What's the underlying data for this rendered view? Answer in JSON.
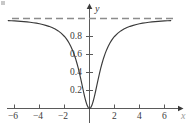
{
  "chart_data": {
    "type": "line",
    "title": "",
    "subtitle": "",
    "xlabel": "x",
    "ylabel": "y",
    "xlim": [
      -7.2,
      7.3
    ],
    "ylim": [
      -0.12,
      1.22
    ],
    "grid": false,
    "legend": "none",
    "axis_style": "arrows-both-ends",
    "xticks": [
      -6,
      -4,
      -2,
      2,
      4,
      6
    ],
    "xtick_labels": [
      "−6",
      "−4",
      "−2",
      "2",
      "4",
      "6"
    ],
    "yticks": [
      0.2,
      0.4,
      0.6,
      0.8
    ],
    "ytick_labels": [
      "0.2",
      "0.4",
      "0.6",
      "0.8"
    ],
    "series": [
      {
        "name": "y = x²/(x²+1)",
        "style": "solid",
        "color": "#3a3a3a",
        "x": [
          -7.2,
          -7,
          -6.75,
          -6.5,
          -6.25,
          -6,
          -5.75,
          -5.5,
          -5.25,
          -5,
          -4.75,
          -4.5,
          -4.25,
          -4,
          -3.75,
          -3.5,
          -3.25,
          -3,
          -2.75,
          -2.5,
          -2.25,
          -2,
          -1.875,
          -1.75,
          -1.625,
          -1.5,
          -1.375,
          -1.25,
          -1.125,
          -1,
          -0.9,
          -0.8,
          -0.7,
          -0.6,
          -0.5,
          -0.4,
          -0.3,
          -0.2,
          -0.1,
          0,
          0.1,
          0.2,
          0.3,
          0.4,
          0.5,
          0.6,
          0.7,
          0.8,
          0.9,
          1,
          1.125,
          1.25,
          1.375,
          1.5,
          1.625,
          1.75,
          1.875,
          2,
          2.25,
          2.5,
          2.75,
          3,
          3.25,
          3.5,
          3.75,
          4,
          4.25,
          4.5,
          4.75,
          5,
          5.25,
          5.5,
          5.75,
          6,
          6.25,
          6.5,
          6.75,
          7,
          7.2
        ],
        "y": [
          0.981,
          0.98,
          0.979,
          0.977,
          0.975,
          0.973,
          0.971,
          0.968,
          0.965,
          0.962,
          0.958,
          0.953,
          0.948,
          0.941,
          0.934,
          0.924,
          0.913,
          0.9,
          0.883,
          0.862,
          0.835,
          0.8,
          0.779,
          0.754,
          0.725,
          0.692,
          0.654,
          0.61,
          0.559,
          0.5,
          0.448,
          0.39,
          0.329,
          0.265,
          0.2,
          0.138,
          0.083,
          0.038,
          0.0099,
          0,
          0.0099,
          0.038,
          0.083,
          0.138,
          0.2,
          0.265,
          0.329,
          0.39,
          0.448,
          0.5,
          0.559,
          0.61,
          0.654,
          0.692,
          0.725,
          0.754,
          0.779,
          0.8,
          0.835,
          0.862,
          0.883,
          0.9,
          0.913,
          0.924,
          0.934,
          0.941,
          0.948,
          0.953,
          0.958,
          0.962,
          0.965,
          0.968,
          0.971,
          0.973,
          0.975,
          0.977,
          0.979,
          0.98,
          0.981
        ]
      }
    ],
    "annotations": [
      {
        "kind": "horizontal-asymptote",
        "label": "",
        "y": 1,
        "style": "dashed",
        "color": "#8c8c8c",
        "x_from": -6.2,
        "x_to": 6.9
      }
    ]
  }
}
